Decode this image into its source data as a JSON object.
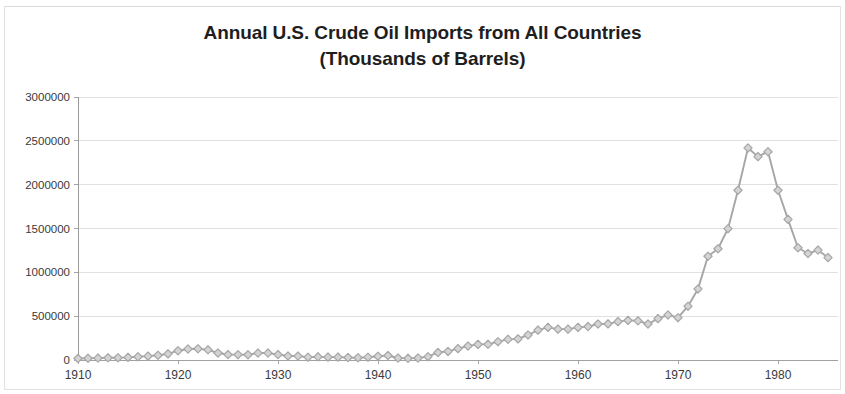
{
  "chart_data": {
    "type": "line",
    "title": "Annual U.S. Crude Oil Imports from All Countries (Thousands of Barrels)",
    "title_lines": [
      "Annual U.S. Crude Oil Imports from All Countries",
      "(Thousands of Barrels)"
    ],
    "xlabel": "",
    "ylabel": "",
    "xlim": [
      1910,
      1986
    ],
    "ylim": [
      0,
      3000000
    ],
    "x_ticks": [
      1910,
      1920,
      1930,
      1940,
      1950,
      1960,
      1970,
      1980
    ],
    "x_tick_labels": [
      "1910",
      "1920",
      "1930",
      "1940",
      "1950",
      "1960",
      "1970",
      "1980"
    ],
    "y_ticks": [
      0,
      500000,
      1000000,
      1500000,
      2000000,
      2500000,
      3000000
    ],
    "y_tick_labels": [
      "0",
      "500000",
      "1000000",
      "1500000",
      "2000000",
      "2500000",
      "3000000"
    ],
    "grid": true,
    "grid_axis": "y",
    "legend": false,
    "legend_position": "none",
    "marker": "diamond",
    "series_color": "#a6a6a6",
    "grid_color": "#d9d9d9",
    "axis_color": "#9a9a9a",
    "text_color": "#3a3a3a",
    "title_color": "#1e1e1e",
    "series": [
      {
        "name": "Annual U.S. Crude Oil Imports",
        "x": [
          1910,
          1911,
          1912,
          1913,
          1914,
          1915,
          1916,
          1917,
          1918,
          1919,
          1920,
          1921,
          1922,
          1923,
          1924,
          1925,
          1926,
          1927,
          1928,
          1929,
          1930,
          1931,
          1932,
          1933,
          1934,
          1935,
          1936,
          1937,
          1938,
          1939,
          1940,
          1941,
          1942,
          1943,
          1944,
          1945,
          1946,
          1947,
          1948,
          1949,
          1950,
          1951,
          1952,
          1953,
          1954,
          1955,
          1956,
          1957,
          1958,
          1959,
          1960,
          1961,
          1962,
          1963,
          1964,
          1965,
          1966,
          1967,
          1968,
          1969,
          1970,
          1971,
          1972,
          1973,
          1974,
          1975,
          1976,
          1977,
          1978,
          1979,
          1980,
          1981,
          1982,
          1983,
          1984,
          1985
        ],
        "values": [
          17000,
          20000,
          22000,
          25000,
          26000,
          30000,
          37000,
          44000,
          54000,
          70000,
          106000,
          125000,
          128000,
          116000,
          80000,
          62000,
          61000,
          60000,
          79000,
          79000,
          62000,
          46000,
          45000,
          32000,
          36000,
          33000,
          33000,
          28000,
          26000,
          32000,
          43000,
          51000,
          23000,
          19000,
          23000,
          38000,
          86000,
          98000,
          130000,
          160000,
          178000,
          179000,
          209000,
          236000,
          241000,
          285000,
          341000,
          372000,
          352000,
          352000,
          372000,
          381000,
          411000,
          412000,
          438000,
          452000,
          447000,
          411000,
          472000,
          514000,
          483000,
          614000,
          811000,
          1184000,
          1269000,
          1498000,
          1936000,
          2419000,
          2320000,
          2376000,
          1936000,
          1604000,
          1280000,
          1215000,
          1254000,
          1168000
        ]
      }
    ],
    "annotations": []
  },
  "figure": {
    "plot_left_px": 78,
    "plot_right_px": 838,
    "plot_top_px": 97,
    "plot_bottom_px": 360
  }
}
